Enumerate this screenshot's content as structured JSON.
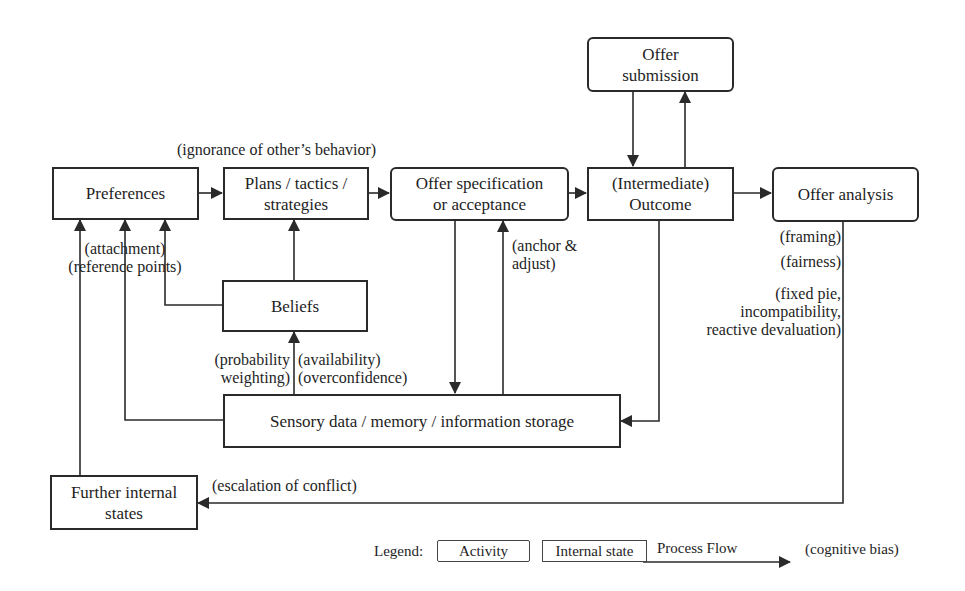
{
  "diagram": {
    "type": "negotiation process flow with cognitive biases",
    "nodes": {
      "preferences": {
        "label": "Preferences",
        "kind": "internal_state"
      },
      "plans": {
        "label": "Plans / tactics /\nstrategies",
        "kind": "internal_state"
      },
      "offer_spec": {
        "label": "Offer specification\nor acceptance",
        "kind": "activity"
      },
      "outcome": {
        "label": "(Intermediate)\nOutcome",
        "kind": "internal_state"
      },
      "offer_submission": {
        "label": "Offer\nsubmission",
        "kind": "activity"
      },
      "offer_analysis": {
        "label": "Offer analysis",
        "kind": "activity"
      },
      "beliefs": {
        "label": "Beliefs",
        "kind": "internal_state"
      },
      "sensory": {
        "label": "Sensory data / memory / information storage",
        "kind": "internal_state"
      },
      "further": {
        "label": "Further internal\nstates",
        "kind": "internal_state"
      }
    },
    "biases": {
      "ignorance": "(ignorance of other’s behavior)",
      "attachment": "(attachment)\n(reference points)",
      "anchor": "(anchor &\nadjust)",
      "probability": "(probability\nweighting)",
      "availability": "(availability)\n(overconfidence)",
      "framing": "(framing)",
      "fairness": "(fairness)",
      "fixed_pie": "(fixed pie,\nincompatibility,\nreactive devaluation)",
      "escalation": "(escalation of conflict)"
    },
    "edges": [
      {
        "from": "preferences",
        "to": "plans"
      },
      {
        "from": "plans",
        "to": "offer_spec",
        "bias": "ignorance"
      },
      {
        "from": "offer_spec",
        "to": "outcome"
      },
      {
        "from": "outcome",
        "to": "offer_analysis"
      },
      {
        "from": "offer_submission",
        "to": "outcome"
      },
      {
        "from": "outcome",
        "to": "offer_submission"
      },
      {
        "from": "offer_spec",
        "to": "sensory"
      },
      {
        "from": "sensory",
        "to": "offer_spec",
        "bias": "anchor"
      },
      {
        "from": "outcome",
        "to": "sensory"
      },
      {
        "from": "sensory",
        "to": "beliefs",
        "bias": [
          "probability",
          "availability"
        ]
      },
      {
        "from": "beliefs",
        "to": "plans"
      },
      {
        "from": "beliefs",
        "to": "preferences"
      },
      {
        "from": "sensory",
        "to": "preferences",
        "bias": "attachment"
      },
      {
        "from": "further",
        "to": "preferences"
      },
      {
        "from": "offer_analysis",
        "to": "further",
        "bias": [
          "framing",
          "fairness",
          "fixed_pie",
          "escalation"
        ]
      }
    ]
  },
  "legend": {
    "title": "Legend:",
    "activity": "Activity",
    "internal_state": "Internal state",
    "process_flow": "Process Flow",
    "cognitive_bias": "(cognitive bias)"
  },
  "colors": {
    "line": "#2a2a2a",
    "background": "#ffffff",
    "text": "#1e1e1e"
  }
}
